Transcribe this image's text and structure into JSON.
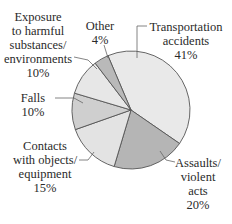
{
  "chart_data": {
    "type": "pie",
    "title": "",
    "categories": [
      "Transportation accidents",
      "Assaults/violent acts",
      "Contacts with objects/equipment",
      "Falls",
      "Exposure to harmful substances/environments",
      "Other"
    ],
    "values": [
      41,
      20,
      15,
      10,
      10,
      4
    ],
    "units": "%",
    "start_angle_deg": -23,
    "direction": "clockwise",
    "colors": [
      "#e9e9e9",
      "#b5b5b5",
      "#e3e3e3",
      "#cfcfcf",
      "#e7e7e7",
      "#b9b9b9"
    ],
    "legend": "none (direct labels with leader lines)"
  },
  "labels": [
    {
      "lines": [
        "Transportation",
        "accidents",
        "41%"
      ],
      "x": 186,
      "y": 20
    },
    {
      "lines": [
        "Assaults/",
        "violent",
        "acts",
        "20%"
      ],
      "x": 198,
      "y": 156
    },
    {
      "lines": [
        "Contacts",
        "with objects/",
        "equipment",
        "15%"
      ],
      "x": 45,
      "y": 139
    },
    {
      "lines": [
        "Falls",
        "10%"
      ],
      "x": 33,
      "y": 91
    },
    {
      "lines": [
        "Exposure",
        "to harmful",
        "substances/",
        "environments",
        "10%"
      ],
      "x": 38,
      "y": 10
    },
    {
      "lines": [
        "Other",
        "4%"
      ],
      "x": 100,
      "y": 19
    }
  ],
  "leaders": [
    [
      [
        147,
        26
      ],
      [
        137,
        26
      ],
      [
        137,
        58
      ]
    ],
    [
      [
        175,
        162
      ],
      [
        166,
        160
      ],
      [
        160,
        151
      ]
    ],
    [
      [
        79,
        160
      ],
      [
        88,
        160
      ],
      [
        94,
        152
      ]
    ],
    [
      [
        55,
        98
      ],
      [
        74,
        98
      ],
      [
        83,
        103
      ]
    ],
    [
      [
        74,
        57
      ],
      [
        88,
        60
      ],
      [
        97,
        69
      ]
    ],
    [
      [
        104,
        45
      ],
      [
        108,
        58
      ]
    ]
  ],
  "pie": {
    "cx": 131,
    "cy": 110,
    "r": 59,
    "stroke": "#555555"
  }
}
